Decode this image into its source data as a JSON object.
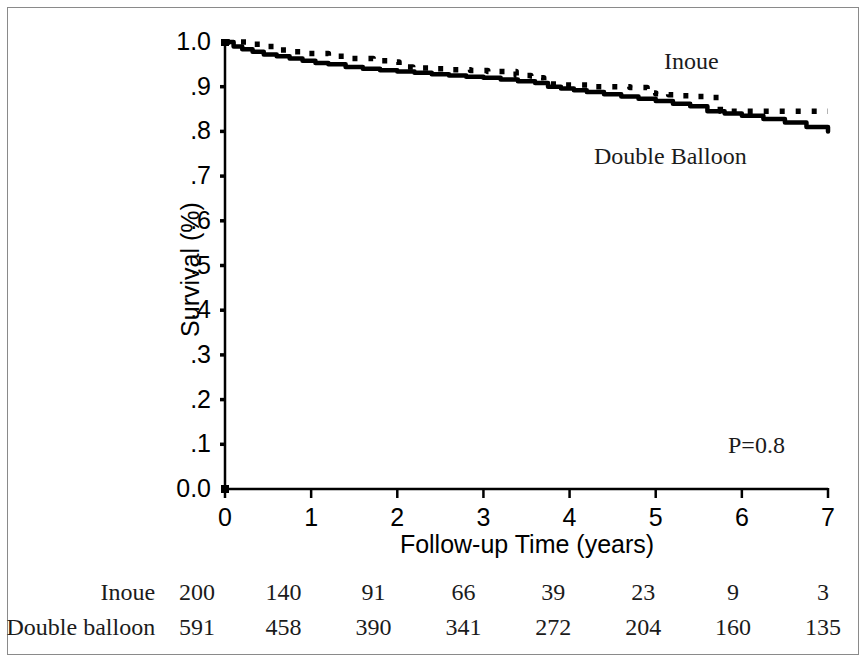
{
  "figure": {
    "title": "",
    "background_color": "#ffffff",
    "frame_color": "#8a8a8a",
    "line_color": "#000000"
  },
  "chart_data": {
    "type": "line",
    "title": "",
    "subtitle": "",
    "xlabel": "Follow-up Time (years)",
    "ylabel": "Survival (%)",
    "xlim": [
      0,
      7
    ],
    "ylim": [
      0.0,
      1.0
    ],
    "grid": false,
    "legend_position": "inline-annotation",
    "x_ticks": [
      "0",
      "1",
      "2",
      "3",
      "4",
      "5",
      "6",
      "7"
    ],
    "x_tick_values": [
      0,
      1,
      2,
      3,
      4,
      5,
      6,
      7
    ],
    "y_ticks": [
      "1.0",
      ".9",
      ".8",
      ".7",
      ".6",
      ".5",
      ".4",
      ".3",
      ".2",
      ".1",
      "0.0"
    ],
    "y_tick_values": [
      1.0,
      0.9,
      0.8,
      0.7,
      0.6,
      0.5,
      0.4,
      0.3,
      0.2,
      0.1,
      0.0
    ],
    "annotations": [
      {
        "name": "p-value",
        "text": "P=0.8",
        "x": 5.85,
        "y": 0.115
      },
      {
        "name": "series-label-inoue",
        "text": "Inoue",
        "x": 5.11,
        "y": 0.945
      },
      {
        "name": "series-label-double-balloon",
        "text": "Double Balloon",
        "x": 4.29,
        "y": 0.735
      }
    ],
    "series": [
      {
        "name": "Inoue",
        "style": "dotted",
        "color": "#000000",
        "x": [
          0,
          0.28,
          0.42,
          0.6,
          0.78,
          0.95,
          1.2,
          1.45,
          1.72,
          1.95,
          2.02,
          2.18,
          2.4,
          2.62,
          2.85,
          3.05,
          3.3,
          3.38,
          3.55,
          3.62,
          3.7,
          3.95,
          4.3,
          4.7,
          4.9,
          5.0,
          5.15,
          5.3,
          5.45,
          5.6,
          5.75,
          6.3,
          7.0
        ],
        "y": [
          1.0,
          0.995,
          0.99,
          0.982,
          0.978,
          0.974,
          0.968,
          0.963,
          0.958,
          0.955,
          0.944,
          0.942,
          0.94,
          0.938,
          0.936,
          0.934,
          0.934,
          0.925,
          0.924,
          0.92,
          0.906,
          0.904,
          0.9,
          0.898,
          0.886,
          0.884,
          0.882,
          0.88,
          0.878,
          0.876,
          0.845,
          0.845,
          0.845
        ]
      },
      {
        "name": "Double Balloon",
        "style": "solid",
        "color": "#000000",
        "x": [
          0,
          0.1,
          0.2,
          0.32,
          0.45,
          0.6,
          0.75,
          0.9,
          1.05,
          1.2,
          1.4,
          1.6,
          1.8,
          2.0,
          2.2,
          2.4,
          2.6,
          2.8,
          3.0,
          3.2,
          3.4,
          3.6,
          3.75,
          3.9,
          4.05,
          4.2,
          4.4,
          4.6,
          4.8,
          5.0,
          5.2,
          5.4,
          5.6,
          5.8,
          6.0,
          6.25,
          6.5,
          6.75,
          7.0
        ],
        "y": [
          1.0,
          0.99,
          0.984,
          0.978,
          0.972,
          0.968,
          0.963,
          0.958,
          0.953,
          0.95,
          0.944,
          0.94,
          0.937,
          0.934,
          0.931,
          0.928,
          0.925,
          0.922,
          0.92,
          0.916,
          0.912,
          0.908,
          0.9,
          0.896,
          0.892,
          0.888,
          0.883,
          0.878,
          0.873,
          0.868,
          0.862,
          0.856,
          0.845,
          0.84,
          0.835,
          0.828,
          0.82,
          0.81,
          0.8
        ]
      }
    ]
  },
  "risk_table": {
    "rows": [
      {
        "label": "Inoue",
        "values": [
          "200",
          "140",
          "91",
          "66",
          "39",
          "23",
          "9",
          "3"
        ]
      },
      {
        "label": "Double balloon",
        "values": [
          "591",
          "458",
          "390",
          "341",
          "272",
          "204",
          "160",
          "135"
        ]
      }
    ]
  }
}
